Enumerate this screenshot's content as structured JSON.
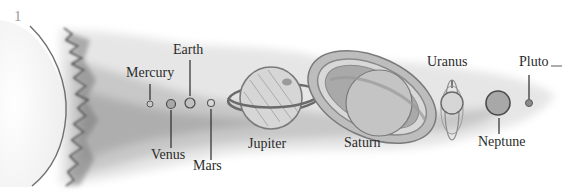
{
  "figure": {
    "number": "1"
  },
  "bodies": [
    {
      "name": "Sun",
      "label": ""
    },
    {
      "name": "Mercury",
      "label": "Mercury"
    },
    {
      "name": "Venus",
      "label": "Venus"
    },
    {
      "name": "Earth",
      "label": "Earth"
    },
    {
      "name": "Mars",
      "label": "Mars"
    },
    {
      "name": "Jupiter",
      "label": "Jupiter"
    },
    {
      "name": "Saturn",
      "label": "Saturn"
    },
    {
      "name": "Uranus",
      "label": "Uranus"
    },
    {
      "name": "Neptune",
      "label": "Neptune"
    },
    {
      "name": "Pluto",
      "label": "Pluto"
    }
  ],
  "colors": {
    "ink": "#2b2b2b",
    "wash_dark": "#8a8a8a",
    "wash_light": "#d9d9d9",
    "planet_fill": "#b8b8b8",
    "figure_number": "#9a9a9a"
  }
}
